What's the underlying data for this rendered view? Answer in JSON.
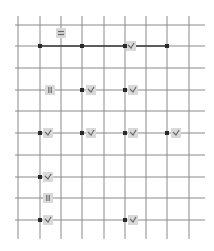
{
  "diagram": {
    "type": "quantum-circuit-grid",
    "colors": {
      "background": "#ffffff",
      "grid_line": "#8a8a8a",
      "wire_active": "#3a3a3a",
      "control_dot": "#2a2a2a",
      "gate_fill": "#d9d9d9",
      "gate_glyph": "#6a6a6a"
    },
    "grid": {
      "columns_x": [
        18,
        40,
        61,
        82,
        104,
        125,
        146,
        167,
        189
      ],
      "column_y_span": [
        16,
        239
      ],
      "rows_y": [
        25,
        46,
        68,
        90,
        111,
        133,
        155,
        177,
        198,
        220
      ],
      "row_x_span": [
        15,
        205
      ]
    },
    "connections": [
      {
        "y": 46,
        "x1": 40,
        "x2": 167
      }
    ],
    "control_dots": [
      {
        "x": 40,
        "y": 46
      },
      {
        "x": 82,
        "y": 46
      },
      {
        "x": 125,
        "y": 46
      },
      {
        "x": 167,
        "y": 46
      },
      {
        "x": 82,
        "y": 90
      },
      {
        "x": 125,
        "y": 90
      },
      {
        "x": 40,
        "y": 133
      },
      {
        "x": 82,
        "y": 133
      },
      {
        "x": 125,
        "y": 133
      },
      {
        "x": 167,
        "y": 133
      },
      {
        "x": 40,
        "y": 177
      },
      {
        "x": 40,
        "y": 220
      },
      {
        "x": 125,
        "y": 220
      }
    ],
    "gates": [
      {
        "x": 61,
        "y": 33,
        "glyph": "equals",
        "icon": "equals-icon"
      },
      {
        "x": 131,
        "y": 46,
        "glyph": "check",
        "icon": "measure-icon"
      },
      {
        "x": 50,
        "y": 90,
        "glyph": "bars",
        "icon": "parallel-bars-icon"
      },
      {
        "x": 91,
        "y": 90,
        "glyph": "check",
        "icon": "measure-icon"
      },
      {
        "x": 133,
        "y": 90,
        "glyph": "check",
        "icon": "measure-icon"
      },
      {
        "x": 48,
        "y": 133,
        "glyph": "check",
        "icon": "measure-icon"
      },
      {
        "x": 91,
        "y": 133,
        "glyph": "check",
        "icon": "measure-icon"
      },
      {
        "x": 133,
        "y": 133,
        "glyph": "check",
        "icon": "measure-icon"
      },
      {
        "x": 176,
        "y": 133,
        "glyph": "check",
        "icon": "measure-icon"
      },
      {
        "x": 48,
        "y": 177,
        "glyph": "check",
        "icon": "measure-icon"
      },
      {
        "x": 48,
        "y": 198,
        "glyph": "bars",
        "icon": "parallel-bars-icon"
      },
      {
        "x": 48,
        "y": 220,
        "glyph": "check",
        "icon": "measure-icon"
      },
      {
        "x": 133,
        "y": 220,
        "glyph": "check",
        "icon": "measure-icon"
      }
    ]
  }
}
